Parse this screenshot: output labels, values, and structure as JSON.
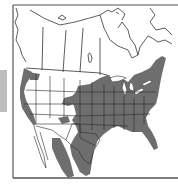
{
  "map": {
    "title": "",
    "region": "North America",
    "legend": [],
    "colors": {
      "range_fill": "#6e6e6e",
      "land_fill": "#ffffff",
      "border_stroke": "#333333",
      "frame_stroke": "#555555",
      "side_bar": "#bdbdbd"
    },
    "shaded_regions": [
      "Eastern and central United States",
      "Texas and Gulf Coast",
      "Florida peninsula",
      "Pacific coast strip (Washington, Oregon, California)",
      "Northern Mexico interior",
      "Southern Ontario / Great Lakes region"
    ]
  }
}
